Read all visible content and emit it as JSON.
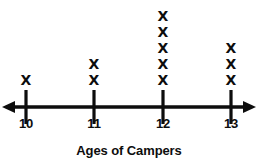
{
  "chart_data": {
    "type": "bar",
    "title": "Ages of Campers",
    "xlabel": "Ages of Campers",
    "ylabel": "",
    "categories": [
      "10",
      "11",
      "12",
      "13"
    ],
    "values": [
      1,
      2,
      5,
      3
    ],
    "mark": "X",
    "grid": false,
    "legend": false,
    "xlim": [
      9.66,
      13.33
    ],
    "ylim": [
      0,
      5
    ],
    "axis_style": "number-line-with-double-arrow"
  },
  "axis": {
    "left_arrow_icon": "arrow-left-icon",
    "right_arrow_icon": "arrow-right-icon",
    "ticks": [
      {
        "label": "10",
        "count": 1
      },
      {
        "label": "11",
        "count": 2
      },
      {
        "label": "12",
        "count": 5
      },
      {
        "label": "13",
        "count": 3
      }
    ]
  },
  "colors": {
    "ink": "#0d0d0d",
    "background": "#ffffff"
  },
  "caption": {
    "text": "Ages of Campers"
  }
}
